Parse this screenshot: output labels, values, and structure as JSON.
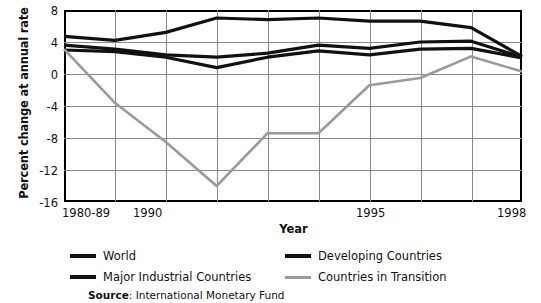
{
  "axes": {
    "ylabel": "Percent change at annual rate",
    "xlabel": "Year",
    "yticks": [
      "8",
      "4",
      "0",
      "-4",
      "-8",
      "-12",
      "-16"
    ],
    "xticks": [
      "1980-89",
      "1990",
      "1995",
      "1998"
    ]
  },
  "legend": {
    "items": [
      {
        "label": "World",
        "color": "#111111",
        "style": "solid-thick"
      },
      {
        "label": "Major Industrial Countries",
        "color": "#111111",
        "style": "solid-thick"
      },
      {
        "label": "Developing Countries",
        "color": "#111111",
        "style": "solid-thick"
      },
      {
        "label": "Countries in Transition",
        "color": "#9a9a9a",
        "style": "solid-thin"
      }
    ]
  },
  "source": {
    "prefix": "Source",
    "separator": ": ",
    "text": "International Monetary Fund"
  },
  "chart_data": {
    "type": "line",
    "title": "",
    "xlabel": "Year",
    "ylabel": "Percent change at annual rate",
    "x": [
      "1980-89",
      "1990",
      "1991",
      "1992",
      "1993",
      "1994",
      "1995",
      "1996",
      "1997",
      "1998"
    ],
    "xtick_labels": [
      "1980-89",
      "1990",
      "",
      "",
      "",
      "",
      "1995",
      "",
      "",
      "1998"
    ],
    "ylim": [
      -16,
      8
    ],
    "ytick_values": [
      8,
      4,
      0,
      -4,
      -8,
      -12,
      -16
    ],
    "grid": true,
    "legend_position": "below",
    "series": [
      {
        "name": "Developing Countries",
        "color": "#111111",
        "values": [
          4.7,
          4.2,
          5.2,
          7.0,
          6.8,
          7.0,
          6.6,
          6.6,
          5.8,
          2.2
        ]
      },
      {
        "name": "World",
        "color": "#111111",
        "values": [
          3.6,
          3.1,
          2.4,
          2.1,
          2.6,
          3.6,
          3.2,
          4.0,
          4.1,
          2.1
        ]
      },
      {
        "name": "Major Industrial Countries",
        "color": "#111111",
        "values": [
          3.0,
          2.8,
          2.1,
          0.8,
          2.1,
          2.9,
          2.4,
          3.1,
          3.2,
          2.0
        ]
      },
      {
        "name": "Countries in Transition",
        "color": "#9a9a9a",
        "values": [
          3.1,
          -3.6,
          -8.5,
          -14.0,
          -7.4,
          -7.4,
          -1.4,
          -0.5,
          2.2,
          0.3
        ]
      }
    ]
  }
}
